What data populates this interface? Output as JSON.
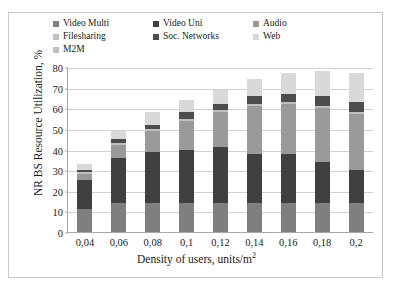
{
  "chart_data": {
    "type": "bar",
    "stacked": true,
    "title": "",
    "xlabel": "Density of users, units/m2",
    "xlabel_text": "Density of users, units/m",
    "xlabel_sup": "2",
    "ylabel": "NR BS Resource Utilization, %",
    "ylim": [
      0,
      80
    ],
    "yticks": [
      0,
      10,
      20,
      30,
      40,
      50,
      60,
      70,
      80
    ],
    "ytick_labels": [
      "0",
      "10",
      "20",
      "30",
      "40",
      "50",
      "60",
      "70",
      "80"
    ],
    "grid": true,
    "legend_position": "top",
    "categories": [
      "0,04",
      "0,06",
      "0,08",
      "0,1",
      "0,12",
      "0,14",
      "0,16",
      "0,18",
      "0,2"
    ],
    "series": [
      {
        "name": "Video Multi",
        "color": "#7f7f7f",
        "values": [
          11,
          14,
          14,
          14,
          14,
          14,
          14,
          14,
          14
        ]
      },
      {
        "name": "Video Uni",
        "color": "#404040",
        "values": [
          14,
          22,
          25,
          26,
          27,
          24,
          24,
          20,
          16
        ]
      },
      {
        "name": "Audio",
        "color": "#9a9a9a",
        "values": [
          3,
          6,
          10,
          14,
          17,
          23,
          24,
          26,
          27
        ]
      },
      {
        "name": "Filesharing",
        "color": "#c0c0c0",
        "values": [
          1,
          1,
          1,
          1,
          1,
          1,
          1,
          1,
          1
        ]
      },
      {
        "name": "Soc. Networks",
        "color": "#4d4d4d",
        "values": [
          1,
          2,
          2,
          3,
          3,
          4,
          4,
          5,
          5
        ]
      },
      {
        "name": "Web",
        "color": "#d9d9d9",
        "values": [
          3,
          4,
          6,
          6,
          7,
          8,
          10,
          12,
          14
        ]
      },
      {
        "name": "M2M",
        "color": "#bfbfbf",
        "values": [
          0,
          0,
          0,
          0,
          0,
          0,
          0,
          0,
          0
        ]
      }
    ],
    "totals": [
      33,
      49,
      58,
      64,
      69,
      74,
      77,
      78,
      77
    ]
  }
}
